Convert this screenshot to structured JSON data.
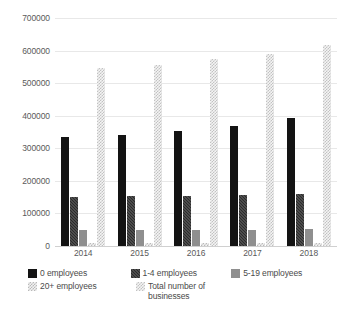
{
  "chart_data": {
    "type": "bar",
    "title": "",
    "subtitle": "",
    "xlabel": "",
    "ylabel": "",
    "categories": [
      "2014",
      "2015",
      "2016",
      "2017",
      "2018"
    ],
    "ylim": [
      0,
      700000
    ],
    "ytick_labels": [
      "0",
      "100000",
      "200000",
      "300000",
      "400000",
      "500000",
      "600000",
      "700000"
    ],
    "ytick_values": [
      0,
      100000,
      200000,
      300000,
      400000,
      500000,
      600000,
      700000
    ],
    "grid": true,
    "legend_position": "bottom",
    "series": [
      {
        "name": "0 employees",
        "color": "#131313",
        "pattern": "solid",
        "values": [
          334000,
          340000,
          352000,
          367000,
          392000
        ]
      },
      {
        "name": "1-4 employees",
        "color": "#2b2b2b",
        "pattern": "dense-hatch",
        "values": [
          151000,
          153000,
          155000,
          156000,
          160000
        ]
      },
      {
        "name": "5-19 employees",
        "color": "#8f8f8f",
        "pattern": "solid",
        "values": [
          49000,
          49500,
          50000,
          50500,
          51000
        ]
      },
      {
        "name": "20+ employees",
        "color": "#b9b9b9",
        "pattern": "checker",
        "values": [
          9000,
          9200,
          9500,
          9800,
          10000
        ]
      },
      {
        "name": "Total number of businesses",
        "color": "#c2c2c2",
        "pattern": "checker",
        "values": [
          548000,
          555000,
          573000,
          590000,
          618000
        ]
      }
    ]
  },
  "legend": {
    "rows": [
      [
        {
          "label": "0 employees",
          "series_index": 0
        },
        {
          "label": "1-4 employees",
          "series_index": 1
        },
        {
          "label": "5-19 employees",
          "series_index": 2
        }
      ],
      [
        {
          "label": "20+ employees",
          "series_index": 3
        },
        {
          "label": "Total number of\nbusinesses",
          "series_index": 4
        }
      ]
    ]
  }
}
